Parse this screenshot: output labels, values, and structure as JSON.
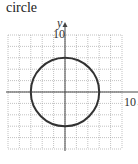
{
  "title": "circle",
  "chart_data": {
    "type": "line",
    "title": "circle",
    "xlabel": "x",
    "ylabel": "y",
    "xlim": [
      -10,
      10
    ],
    "ylim": [
      -10,
      10
    ],
    "grid": true,
    "grid_step": 2,
    "tick_labels": {
      "x": [
        "10"
      ],
      "y": [
        "10"
      ]
    },
    "curve": {
      "shape": "circle",
      "center": [
        0,
        0
      ],
      "radius": 6
    },
    "colors": {
      "curve": "#333333",
      "grid": "#999999",
      "axes": "#444444"
    }
  },
  "axes": {
    "x_label": "x",
    "y_label": "y",
    "x_tick": "10",
    "y_tick": "10"
  }
}
